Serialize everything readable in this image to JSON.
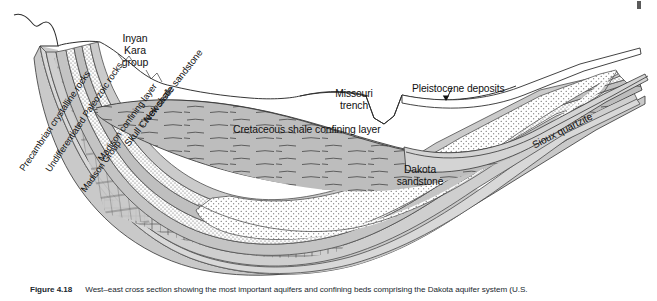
{
  "figure": {
    "number": "Figure 4.18",
    "caption": "West–east cross section showing the most important aquifers and confining beds comprising the Dakota aquifer system (U.S.",
    "orientation": "west-east"
  },
  "labels": {
    "inyan_kara": "Inyan\nKara\ngroup",
    "inyan_kara_line1": "Inyan",
    "inyan_kara_line2": "Kara",
    "inyan_kara_line3": "group",
    "newcastle_sandstone": "Newcastle sandstone",
    "skull_creek_shale": "Skull Creek shale",
    "madison_confining_layer": "Madison confining layer",
    "madison_group": "Madison Group",
    "undifferentiated_paleozoic": "Undifferentiated Paleozoic rocks",
    "precambrian": "Precambrian crystalline rocks",
    "cretaceous_shale": "Cretaceous shale confining layer",
    "missouri_trench_line1": "Missouri",
    "missouri_trench_line2": "trench",
    "pleistocene_deposits": "Pleistocene deposits",
    "sioux_quartzite": "Sioux quartzite",
    "dakota_line1": "Dakota",
    "dakota_line2": "sandstone"
  },
  "units": [
    {
      "name": "Precambrian crystalline rocks",
      "pattern": "plain-gray",
      "role": "basement"
    },
    {
      "name": "Undifferentiated Paleozoic rocks",
      "pattern": "plain-gray",
      "role": "confining"
    },
    {
      "name": "Madison Group",
      "pattern": "brick-limestone",
      "role": "aquifer"
    },
    {
      "name": "Madison confining layer",
      "pattern": "plain-gray",
      "role": "confining"
    },
    {
      "name": "Skull Creek shale",
      "pattern": "stipple",
      "role": "confining"
    },
    {
      "name": "Newcastle sandstone",
      "pattern": "plain-gray",
      "role": "aquifer"
    },
    {
      "name": "Inyan Kara group",
      "pattern": "stipple",
      "role": "aquifer"
    },
    {
      "name": "Dakota sandstone",
      "pattern": "stipple",
      "role": "aquifer"
    },
    {
      "name": "Cretaceous shale confining layer",
      "pattern": "dashed-shale",
      "role": "confining"
    },
    {
      "name": "Pleistocene deposits",
      "pattern": "plain-white",
      "role": "surficial"
    },
    {
      "name": "Sioux quartzite",
      "pattern": "plain-gray",
      "role": "basement"
    }
  ],
  "features": [
    {
      "name": "Missouri trench",
      "type": "erosional-notch"
    }
  ],
  "colors": {
    "ink": "#1a1a1a",
    "gray_dark": "#9e9e9e",
    "gray_mid": "#bcbcbc",
    "gray_light": "#d2d2d2",
    "gray_pale": "#e3e3e3",
    "white": "#ffffff",
    "caption": "#20272e"
  }
}
